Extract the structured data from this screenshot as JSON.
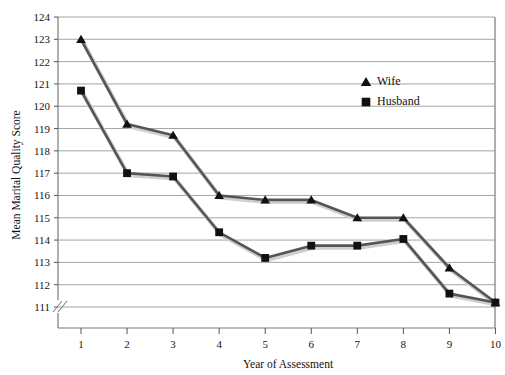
{
  "chart_data": {
    "type": "line",
    "title": "",
    "xlabel": "Year of Assessment",
    "ylabel": "Mean Marital Quality Score",
    "categories": [
      1,
      2,
      3,
      4,
      5,
      6,
      7,
      8,
      9,
      10
    ],
    "x": [
      1,
      2,
      3,
      4,
      5,
      6,
      7,
      8,
      9,
      10
    ],
    "xlim": [
      1,
      10
    ],
    "ylim": [
      111,
      124
    ],
    "y_axis_break": true,
    "grid": true,
    "legend_position": "top-right",
    "series": [
      {
        "name": "Wife",
        "marker": "triangle",
        "color": "#111111",
        "values": [
          123.0,
          119.2,
          118.7,
          116.0,
          115.8,
          115.8,
          115.0,
          115.0,
          112.75,
          111.2
        ]
      },
      {
        "name": "Husband",
        "marker": "square",
        "color": "#111111",
        "values": [
          120.7,
          117.0,
          116.85,
          114.35,
          113.2,
          113.75,
          113.75,
          114.05,
          111.6,
          111.2
        ]
      }
    ],
    "ytick_labels": [
      "111",
      "112",
      "113",
      "114",
      "115",
      "116",
      "117",
      "118",
      "119",
      "120",
      "121",
      "122",
      "123",
      "124"
    ],
    "ytick_values": [
      111,
      112,
      113,
      114,
      115,
      116,
      117,
      118,
      119,
      120,
      121,
      122,
      123,
      124
    ],
    "xtick_labels": [
      "1",
      "2",
      "3",
      "4",
      "5",
      "6",
      "7",
      "8",
      "9",
      "10"
    ]
  },
  "legend": {
    "entries": [
      {
        "label": "Wife",
        "marker": "triangle"
      },
      {
        "label": "Husband",
        "marker": "square"
      }
    ]
  }
}
